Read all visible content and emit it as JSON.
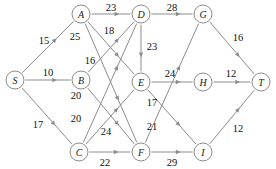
{
  "diagram": {
    "colors": {
      "edge": "#8c8c8c",
      "node_stroke": "#8c8c8c",
      "node_fill": "#ffffff",
      "label_text": "#111111",
      "background": "#ffffff"
    },
    "nodes": [
      {
        "id": "S",
        "label": "S",
        "x": 15,
        "y": 80,
        "r": 9
      },
      {
        "id": "A",
        "label": "A",
        "x": 81,
        "y": 14,
        "r": 9
      },
      {
        "id": "B",
        "label": "B",
        "x": 81,
        "y": 80,
        "r": 9
      },
      {
        "id": "C",
        "label": "C",
        "x": 79,
        "y": 152,
        "r": 9
      },
      {
        "id": "D",
        "label": "D",
        "x": 141,
        "y": 14,
        "r": 9
      },
      {
        "id": "E",
        "label": "E",
        "x": 141,
        "y": 82,
        "r": 9
      },
      {
        "id": "F",
        "label": "F",
        "x": 141,
        "y": 152,
        "r": 9
      },
      {
        "id": "G",
        "label": "G",
        "x": 203,
        "y": 14,
        "r": 9
      },
      {
        "id": "H",
        "label": "H",
        "x": 203,
        "y": 82,
        "r": 9
      },
      {
        "id": "I",
        "label": "I",
        "x": 203,
        "y": 152,
        "r": 9
      },
      {
        "id": "T",
        "label": "T",
        "x": 261,
        "y": 82,
        "r": 9
      }
    ],
    "edges": [
      {
        "from": "S",
        "to": "A",
        "weight": "15",
        "lx": 44,
        "ly": 40
      },
      {
        "from": "S",
        "to": "B",
        "weight": "10",
        "lx": 48,
        "ly": 72
      },
      {
        "from": "S",
        "to": "C",
        "weight": "17",
        "lx": 38,
        "ly": 124
      },
      {
        "from": "A",
        "to": "D",
        "weight": "23",
        "lx": 111,
        "ly": 7
      },
      {
        "from": "A",
        "to": "E",
        "weight": "18",
        "lx": 109,
        "ly": 30
      },
      {
        "from": "A",
        "to": "F",
        "weight": "25",
        "lx": 75,
        "ly": 36
      },
      {
        "from": "B",
        "to": "D",
        "weight": "16",
        "lx": 90,
        "ly": 60
      },
      {
        "from": "B",
        "to": "F",
        "weight": "20",
        "lx": 76,
        "ly": 95
      },
      {
        "from": "C",
        "to": "E",
        "weight": "20",
        "lx": 76,
        "ly": 118
      },
      {
        "from": "C",
        "to": "D",
        "weight": "24",
        "lx": 106,
        "ly": 131
      },
      {
        "from": "C",
        "to": "F",
        "weight": "22",
        "lx": 105,
        "ly": 162
      },
      {
        "from": "D",
        "to": "G",
        "weight": "28",
        "lx": 172,
        "ly": 7
      },
      {
        "from": "D",
        "to": "E",
        "weight": "23",
        "lx": 152,
        "ly": 46
      },
      {
        "from": "E",
        "to": "H",
        "weight": "24",
        "lx": 170,
        "ly": 73
      },
      {
        "from": "E",
        "to": "I",
        "weight": "17",
        "lx": 152,
        "ly": 102
      },
      {
        "from": "F",
        "to": "G",
        "weight": "21",
        "lx": 152,
        "ly": 126
      },
      {
        "from": "F",
        "to": "I",
        "weight": "29",
        "lx": 172,
        "ly": 162
      },
      {
        "from": "G",
        "to": "T",
        "weight": "16",
        "lx": 238,
        "ly": 37
      },
      {
        "from": "H",
        "to": "T",
        "weight": "12",
        "lx": 231,
        "ly": 73
      },
      {
        "from": "I",
        "to": "T",
        "weight": "12",
        "lx": 238,
        "ly": 128
      }
    ]
  }
}
